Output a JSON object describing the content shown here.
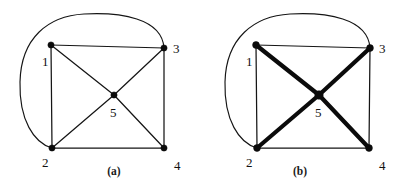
{
  "figure": {
    "background_color": "#ffffff",
    "ink_color": "#111111",
    "width": 401,
    "height": 186,
    "panels": [
      {
        "id": "panel-a",
        "caption": "(a)",
        "caption_position": {
          "x": 114,
          "y": 175
        },
        "vertices": [
          {
            "id": "v1",
            "label": "1",
            "x": 51,
            "y": 45,
            "label_x": 42,
            "label_y": 66,
            "radius": 3.1
          },
          {
            "id": "v2",
            "label": "2",
            "x": 52,
            "y": 148,
            "label_x": 42,
            "label_y": 167,
            "radius": 3.1
          },
          {
            "id": "v3",
            "label": "3",
            "x": 164,
            "y": 48,
            "label_x": 173,
            "label_y": 53,
            "radius": 3.1
          },
          {
            "id": "v4",
            "label": "4",
            "x": 164,
            "y": 148,
            "label_x": 174,
            "label_y": 170,
            "radius": 3.1
          },
          {
            "id": "v5",
            "label": "5",
            "x": 114,
            "y": 95,
            "label_x": 110,
            "label_y": 117,
            "radius": 3.1
          }
        ],
        "edges": [
          {
            "from": "v1",
            "to": "v3",
            "style": "thin"
          },
          {
            "from": "v1",
            "to": "v2",
            "style": "thin"
          },
          {
            "from": "v2",
            "to": "v4",
            "style": "thin"
          },
          {
            "from": "v3",
            "to": "v4",
            "style": "thin"
          },
          {
            "from": "v1",
            "to": "v5",
            "style": "thin"
          },
          {
            "from": "v5",
            "to": "v4",
            "style": "thin"
          },
          {
            "from": "v2",
            "to": "v5",
            "style": "thin"
          },
          {
            "from": "v5",
            "to": "v3",
            "style": "thin"
          }
        ],
        "curved_edge": {
          "from": "v3",
          "to": "v2",
          "style": "thin",
          "path": "M 164 48 C 162 18, 120 12, 84 14 C 48 16, 21 38, 20 82 C 19 120, 34 143, 52 148"
        }
      },
      {
        "id": "panel-b",
        "caption": "(b)",
        "caption_position": {
          "x": 300,
          "y": 175
        },
        "vertices": [
          {
            "id": "v1",
            "label": "1",
            "x": 256,
            "y": 45,
            "label_x": 246,
            "label_y": 66,
            "radius": 3.4
          },
          {
            "id": "v2",
            "label": "2",
            "x": 257,
            "y": 148,
            "label_x": 246,
            "label_y": 167,
            "radius": 3.4
          },
          {
            "id": "v3",
            "label": "3",
            "x": 370,
            "y": 48,
            "label_x": 379,
            "label_y": 53,
            "radius": 3.4
          },
          {
            "id": "v4",
            "label": "4",
            "x": 369,
            "y": 148,
            "label_x": 379,
            "label_y": 170,
            "radius": 3.4
          },
          {
            "id": "v5",
            "label": "5",
            "x": 319,
            "y": 95,
            "label_x": 315,
            "label_y": 117,
            "radius": 4.2
          }
        ],
        "edges": [
          {
            "from": "v1",
            "to": "v3",
            "style": "thin"
          },
          {
            "from": "v1",
            "to": "v2",
            "style": "thin"
          },
          {
            "from": "v2",
            "to": "v4",
            "style": "thin"
          },
          {
            "from": "v3",
            "to": "v4",
            "style": "thin"
          },
          {
            "from": "v1",
            "to": "v5",
            "style": "bold"
          },
          {
            "from": "v5",
            "to": "v4",
            "style": "bold"
          },
          {
            "from": "v2",
            "to": "v5",
            "style": "bold"
          },
          {
            "from": "v5",
            "to": "v3",
            "style": "bold"
          }
        ],
        "curved_edge": {
          "from": "v3",
          "to": "v2",
          "style": "thin",
          "path": "M 370 48 C 368 18, 326 12, 290 14 C 254 16, 226 38, 225 82 C 224 120, 239 143, 257 148"
        }
      }
    ]
  }
}
